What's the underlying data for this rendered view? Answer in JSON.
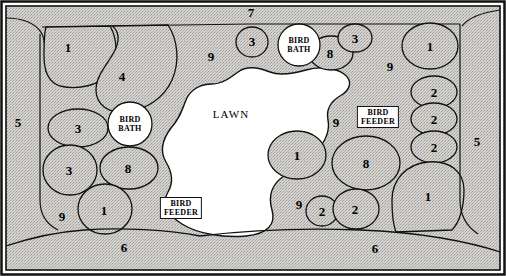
{
  "diagram": {
    "type": "landscape-plan",
    "frame": {
      "border_color": "#111111",
      "background": "#ffffff"
    },
    "bed_fill": "#d0cfcb",
    "bed_stroke": "#111111",
    "lawn_fill": "#ffffff",
    "lawn_label": "LAWN",
    "features": [
      {
        "kind": "bird-bath",
        "label_line1": "BIRD",
        "label_line2": "BATH",
        "x": 130,
        "y": 124
      },
      {
        "kind": "bird-bath",
        "label_line1": "BIRD",
        "label_line2": "BATH",
        "x": 299,
        "y": 45
      },
      {
        "kind": "bird-feeder",
        "label_line1": "BIRD",
        "label_line2": "FEEDER",
        "x": 181,
        "y": 208
      },
      {
        "kind": "bird-feeder",
        "label_line1": "BIRD",
        "label_line2": "FEEDER",
        "x": 378,
        "y": 117
      }
    ],
    "plant_keys": [
      {
        "id": "k01",
        "number": "1",
        "x": 68,
        "y": 47
      },
      {
        "id": "k02",
        "number": "4",
        "x": 122,
        "y": 76
      },
      {
        "id": "k03",
        "number": "5",
        "x": 18,
        "y": 122
      },
      {
        "id": "k04",
        "number": "3",
        "x": 78,
        "y": 128
      },
      {
        "id": "k05",
        "number": "3",
        "x": 69,
        "y": 170
      },
      {
        "id": "k06",
        "number": "8",
        "x": 128,
        "y": 168
      },
      {
        "id": "k07",
        "number": "9",
        "x": 62,
        "y": 216
      },
      {
        "id": "k08",
        "number": "1",
        "x": 104,
        "y": 210
      },
      {
        "id": "k09",
        "number": "6",
        "x": 124,
        "y": 247
      },
      {
        "id": "k10",
        "number": "7",
        "x": 251,
        "y": 12
      },
      {
        "id": "k11",
        "number": "9",
        "x": 211,
        "y": 56
      },
      {
        "id": "k12",
        "number": "3",
        "x": 252,
        "y": 41
      },
      {
        "id": "k13",
        "number": "8",
        "x": 330,
        "y": 53
      },
      {
        "id": "k14",
        "number": "3",
        "x": 355,
        "y": 38
      },
      {
        "id": "k15",
        "number": "9",
        "x": 390,
        "y": 66
      },
      {
        "id": "k16",
        "number": "1",
        "x": 430,
        "y": 46
      },
      {
        "id": "k17",
        "number": "2",
        "x": 434,
        "y": 92
      },
      {
        "id": "k18",
        "number": "2",
        "x": 434,
        "y": 119
      },
      {
        "id": "k19",
        "number": "2",
        "x": 434,
        "y": 147
      },
      {
        "id": "k20",
        "number": "5",
        "x": 477,
        "y": 141
      },
      {
        "id": "k21",
        "number": "9",
        "x": 336,
        "y": 122
      },
      {
        "id": "k22",
        "number": "1",
        "x": 297,
        "y": 155
      },
      {
        "id": "k23",
        "number": "8",
        "x": 366,
        "y": 163
      },
      {
        "id": "k24",
        "number": "9",
        "x": 299,
        "y": 204
      },
      {
        "id": "k25",
        "number": "2",
        "x": 322,
        "y": 211
      },
      {
        "id": "k26",
        "number": "2",
        "x": 355,
        "y": 209
      },
      {
        "id": "k27",
        "number": "1",
        "x": 428,
        "y": 196
      },
      {
        "id": "k28",
        "number": "6",
        "x": 375,
        "y": 248
      }
    ]
  }
}
